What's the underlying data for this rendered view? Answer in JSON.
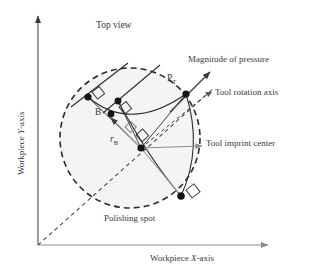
{
  "figure": {
    "title": "Top view",
    "axes": {
      "x_label_prefix": "Workpiece ",
      "x_label_italic": "X",
      "x_label_suffix": "-axis",
      "y_label_prefix": "Workpiece ",
      "y_label_italic": "Y",
      "y_label_suffix": "-axis",
      "x_axis_name": "Workpiece X-axis",
      "y_axis_name": "Workpiece Y-axis"
    },
    "annotations": {
      "magnitude_of_pressure": "Magnitude of pressure",
      "tool_rotation_axis": "Tool rotation axis",
      "tool_imprint_center": "Tool imprint center",
      "polishing_spot": "Polishing spot",
      "point_pt_base": "P",
      "point_pt_sub": "T",
      "point_b": "B",
      "radius_rb_base": "r",
      "radius_rb_sub": "B"
    },
    "colors": {
      "line": "#3a3a3a",
      "gray_line": "#8c8c8c",
      "node_fill": "#1a1a1a",
      "spot_fill": "#f2f2f2",
      "background": "#ffffff"
    },
    "geometry": {
      "polishing_spot_center_x": 130,
      "polishing_spot_center_y": 138,
      "polishing_spot_radius": 70,
      "origin_x": 38,
      "origin_y": 245,
      "nodes": [
        {
          "name": "node-top-left",
          "x": 88,
          "y": 97
        },
        {
          "name": "node-b",
          "x": 111,
          "y": 113
        },
        {
          "name": "node-mid-upper",
          "x": 118,
          "y": 101
        },
        {
          "name": "node-pt",
          "x": 186,
          "y": 94
        },
        {
          "name": "node-center",
          "x": 141,
          "y": 148
        },
        {
          "name": "node-bottom-right",
          "x": 181,
          "y": 196
        }
      ]
    }
  }
}
